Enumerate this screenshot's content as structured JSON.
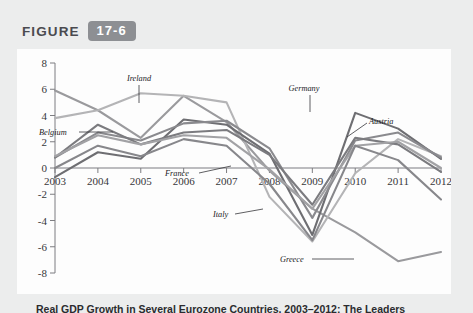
{
  "figure": {
    "word": "FIGURE",
    "number": "17-6"
  },
  "caption": {
    "text": "Real GDP Growth in Several Eurozone Countries, 2003–2012: The Leaders"
  },
  "chart_data": {
    "type": "line",
    "title": "",
    "xlabel": "",
    "ylabel": "",
    "x": [
      2003,
      2004,
      2005,
      2006,
      2007,
      2008,
      2009,
      2010,
      2011,
      2012
    ],
    "xticklabels": [
      "2003",
      "2004",
      "2005",
      "2006",
      "2007",
      "2008",
      "2009",
      "2010",
      "2011",
      "2012"
    ],
    "yticklabels": [
      "8",
      "6",
      "4",
      "2",
      "0",
      "-2",
      "-4",
      "-6",
      "-8"
    ],
    "yticks": [
      8,
      6,
      4,
      2,
      0,
      -2,
      -4,
      -6,
      -8
    ],
    "ylim": [
      -8,
      8
    ],
    "xlim": [
      2003,
      2012
    ],
    "grid": false,
    "legend_position": "inline-annotations",
    "series": [
      {
        "name": "Greece",
        "color": "#9a9a9d",
        "values": [
          5.9,
          4.4,
          2.3,
          5.5,
          3.5,
          -0.2,
          -3.1,
          -4.9,
          -7.1,
          -6.4
        ]
      },
      {
        "name": "Ireland",
        "color": "#b4b4b6",
        "values": [
          3.8,
          4.4,
          5.7,
          5.5,
          5.0,
          -2.2,
          -5.6,
          -0.4,
          2.2,
          0.9
        ]
      },
      {
        "name": "Germany",
        "color": "#6e6e72",
        "values": [
          -0.7,
          1.2,
          0.7,
          3.7,
          3.3,
          1.1,
          -5.1,
          4.2,
          3.0,
          0.7
        ]
      },
      {
        "name": "Austria",
        "color": "#8a8a8e",
        "values": [
          0.8,
          2.7,
          2.1,
          3.4,
          3.6,
          1.5,
          -3.8,
          2.1,
          2.7,
          0.8
        ]
      },
      {
        "name": "Belgium",
        "color": "#7b7b7f",
        "values": [
          0.8,
          3.3,
          1.8,
          2.7,
          2.9,
          1.0,
          -2.8,
          2.3,
          1.8,
          -0.3
        ]
      },
      {
        "name": "France",
        "color": "#a2a2a5",
        "values": [
          0.9,
          2.5,
          1.8,
          2.5,
          2.3,
          -0.1,
          -3.1,
          1.7,
          2.0,
          0.0
        ]
      },
      {
        "name": "Italy",
        "color": "#87878b",
        "values": [
          0.0,
          1.7,
          0.9,
          2.2,
          1.7,
          -1.2,
          -5.5,
          1.7,
          0.6,
          -2.4
        ]
      }
    ],
    "annotations": [
      {
        "name": "Ireland",
        "label": "Ireland"
      },
      {
        "name": "Belgium",
        "label": "Belgium"
      },
      {
        "name": "France",
        "label": "France"
      },
      {
        "name": "Germany",
        "label": "Germany"
      },
      {
        "name": "Austria",
        "label": "Austria"
      },
      {
        "name": "Italy",
        "label": "Italy"
      },
      {
        "name": "Greece",
        "label": "Greece"
      }
    ]
  }
}
